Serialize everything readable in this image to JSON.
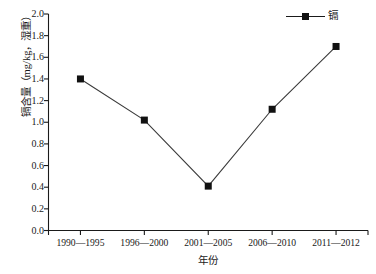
{
  "chart_data": {
    "type": "line",
    "title": "",
    "subtitle": "",
    "xlabel": "年份",
    "ylabel": "镉含量（mg/kg，湿重）",
    "categories": [
      "1990—1995",
      "1996—2000",
      "2001—2005",
      "2006—2010",
      "2011—2012"
    ],
    "series": [
      {
        "name": "镉",
        "values": [
          1.4,
          1.02,
          0.41,
          1.12,
          1.7
        ],
        "marker": "filled-square",
        "color": "#111111"
      }
    ],
    "ylim": [
      0.0,
      2.0
    ],
    "ytick_values": [
      0.0,
      0.2,
      0.4,
      0.6,
      0.8,
      1.0,
      1.2,
      1.4,
      1.6,
      1.8,
      2.0
    ],
    "ytick_labels": [
      "0.0",
      "0.2",
      "0.4",
      "0.6",
      "0.8",
      "1.0",
      "1.2",
      "1.4",
      "1.6",
      "1.8",
      "2.0"
    ],
    "grid": false,
    "legend_position": "top-right",
    "legend_entries": [
      "镉"
    ]
  },
  "axes": {
    "y_title": "镉含量（mg/kg，湿重）",
    "x_title": "年份"
  },
  "legend": {
    "label": "镉"
  },
  "colors": {
    "axis": "#1a1a1a",
    "line": "#3a3a3a",
    "marker": "#111111",
    "background": "#ffffff"
  }
}
